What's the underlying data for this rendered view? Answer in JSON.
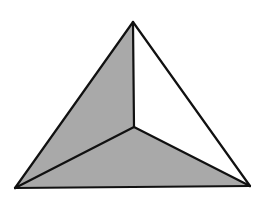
{
  "diagram": {
    "type": "triangular-pyramid-top-view",
    "background": "#ffffff",
    "stroke_color": "#111111",
    "stroke_width": 2.2,
    "vertices": {
      "apex": [
        133,
        22
      ],
      "bottom_left": [
        15,
        188
      ],
      "bottom_right": [
        250,
        186
      ],
      "interior": [
        134,
        127
      ]
    },
    "faces": [
      {
        "name": "left-face",
        "points": [
          "apex",
          "interior",
          "bottom_left"
        ],
        "fill": "#a9a9a9",
        "shaded": true
      },
      {
        "name": "bottom-face",
        "points": [
          "bottom_left",
          "interior",
          "bottom_right"
        ],
        "fill": "#a9a9a9",
        "shaded": true
      },
      {
        "name": "right-face",
        "points": [
          "apex",
          "bottom_right",
          "interior"
        ],
        "fill": "#ffffff",
        "shaded": false
      }
    ],
    "edges": [
      [
        "apex",
        "bottom_left"
      ],
      [
        "apex",
        "bottom_right"
      ],
      [
        "bottom_left",
        "bottom_right"
      ],
      [
        "apex",
        "interior"
      ],
      [
        "interior",
        "bottom_left"
      ],
      [
        "interior",
        "bottom_right"
      ]
    ]
  }
}
